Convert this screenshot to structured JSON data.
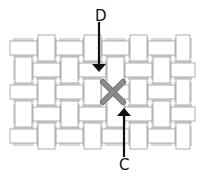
{
  "labels": {
    "top": "D",
    "bottom": "C"
  },
  "colors": {
    "tile_fill": "#ffffff",
    "tile_stroke": "#9a9a9a",
    "gap_fill": "#d8d8d8",
    "cross": "#8c8c8c",
    "cross_stroke": "#6e6e6e",
    "arrow": "#111111"
  },
  "weave": {
    "rows": [
      {
        "y": 37,
        "h": 22
      },
      {
        "y": 59,
        "h": 22
      },
      {
        "y": 81,
        "h": 22
      },
      {
        "y": 103,
        "h": 22
      },
      {
        "y": 125,
        "h": 22
      }
    ],
    "cols": [
      {
        "x": 12,
        "w": 23
      },
      {
        "x": 35,
        "w": 23
      },
      {
        "x": 58,
        "w": 23
      },
      {
        "x": 81,
        "w": 23
      },
      {
        "x": 104,
        "w": 23
      },
      {
        "x": 127,
        "w": 23
      },
      {
        "x": 150,
        "w": 23
      },
      {
        "x": 173,
        "w": 20
      }
    ]
  },
  "marker": {
    "type": "cross",
    "cx": 113,
    "cy": 92
  },
  "arrows": [
    {
      "name": "arrow-d",
      "x": 99,
      "y1": 22,
      "y2": 72,
      "direction": "down"
    },
    {
      "name": "arrow-c",
      "x": 124,
      "y1": 157,
      "y2": 108,
      "direction": "up"
    }
  ]
}
